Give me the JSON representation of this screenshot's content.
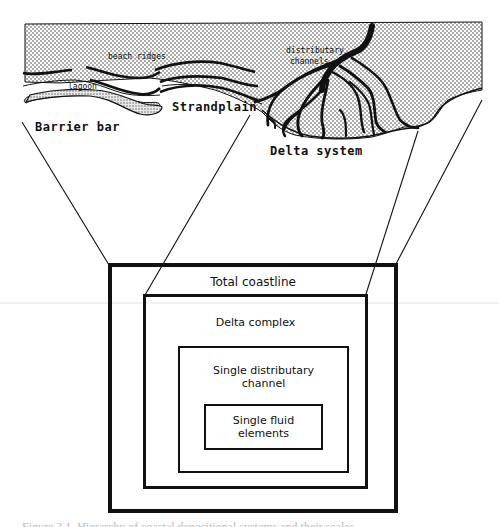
{
  "figure": {
    "map_labels": {
      "beach_ridges": "beach ridges",
      "lagoon": "lagoon",
      "distributary_channels_line1": "distributary",
      "distributary_channels_line2": "channels",
      "barrier_bar": "Barrier bar",
      "strandplain": "Strandplain",
      "delta_system": "Delta system"
    },
    "hierarchy": [
      {
        "level": 1,
        "label": "Total coastline"
      },
      {
        "level": 2,
        "label": "Delta complex"
      },
      {
        "level": 3,
        "label": "Single distributary\nchannel"
      },
      {
        "level": 4,
        "label": "Single fluid\nelements"
      }
    ],
    "caption": "Figure 2.1. Hierarchy of coastal depositional systems and their scales",
    "colors": {
      "ink": "#111111",
      "background": "#ffffff",
      "stipple": "#333333"
    }
  }
}
